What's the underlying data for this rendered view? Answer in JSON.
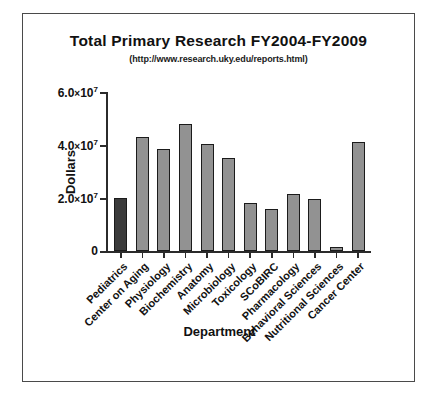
{
  "chart_data": {
    "type": "bar",
    "title": "Total Primary Research FY2004-FY2009",
    "subtitle": "(http://www.research.uky.edu/reports.html)",
    "xlabel": "Department",
    "ylabel": "Dollars",
    "categories": [
      "Pediatrics",
      "Center on Aging",
      "Physiology",
      "Biochemistry",
      "Anatomy",
      "Microbiology",
      "Toxicology",
      "SCoBIRC",
      "Pharmacology",
      "Behavioral Sciences",
      "Nutritional Sciences",
      "Cancer Center"
    ],
    "values": [
      20000000,
      43000000,
      38500000,
      48000000,
      40500000,
      35000000,
      18000000,
      16000000,
      21500000,
      19500000,
      1500000,
      41000000
    ],
    "ylim": [
      0,
      60000000
    ],
    "yticks": [
      0,
      20000000,
      40000000,
      60000000
    ],
    "ytick_labels": [
      "0",
      "2.0×10⁷",
      "4.0×10⁷",
      "6.0×10⁷"
    ],
    "grid": false,
    "legend": false,
    "bar_colors": {
      "default": "#929292",
      "highlight": "#3b3b3b",
      "edge": "#1b1b1b"
    },
    "highlight_index": 0
  }
}
